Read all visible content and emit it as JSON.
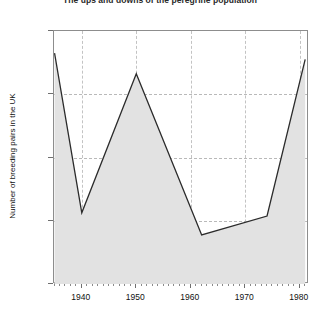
{
  "chart_data": {
    "type": "area",
    "title": "The ups and downs of the peregrine population",
    "xlabel": "",
    "ylabel": "Number of breeding pairs in the UK",
    "xlim": [
      1934.9,
      1981.7
    ],
    "ylim": [
      200,
      1000
    ],
    "grid": true,
    "legend": "none",
    "fill_color": "#e2e2e2",
    "line_color": "#2b2b2b",
    "x_ticks": [
      1940,
      1950,
      1960,
      1970,
      1980
    ],
    "x_tick_labels": [
      "1940",
      "1950",
      "1960",
      "1970",
      "1980"
    ],
    "x_minor_tick_step": 1,
    "y_ticks": [
      200,
      400,
      600,
      800,
      1000
    ],
    "y_tick_labels": [
      "200",
      "400",
      "600",
      "800",
      "1000"
    ],
    "x": [
      1935,
      1940,
      1950,
      1962,
      1974,
      1981
    ],
    "values": [
      930,
      425,
      865,
      355,
      415,
      910
    ],
    "points": [
      {
        "x": 1935,
        "y": 930
      },
      {
        "x": 1940,
        "y": 425
      },
      {
        "x": 1950,
        "y": 865
      },
      {
        "x": 1962,
        "y": 355
      },
      {
        "x": 1974,
        "y": 415
      },
      {
        "x": 1981,
        "y": 910
      }
    ]
  }
}
